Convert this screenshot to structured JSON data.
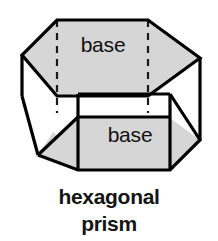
{
  "figure": {
    "name": "hexagonal-prism-diagram",
    "shape_type": "hexagonal prism",
    "top_face_label": "base",
    "bottom_face_label": "base",
    "colors": {
      "shaded_face": "#d6d6d6",
      "unshaded_face": "#ffffff",
      "edge": "#000000",
      "hidden_edge": "#1a1a1a",
      "background": "#ffffff",
      "text": "#111111"
    },
    "edges": {
      "visible_style": "solid",
      "hidden_style": "dashed",
      "stroke_width": 3.2,
      "hidden_stroke_width": 2.2,
      "hidden_dash_pattern": "7 6"
    },
    "geometry": {
      "top_hexagon": [
        [
          57,
          20
        ],
        [
          148,
          20
        ],
        [
          200,
          58
        ],
        [
          148,
          96
        ],
        [
          57,
          96
        ],
        [
          22,
          55
        ]
      ],
      "bottom_hexagon": [
        [
          78,
          94
        ],
        [
          170,
          94
        ],
        [
          200,
          140
        ],
        [
          170,
          170
        ],
        [
          78,
          170
        ],
        [
          38,
          155
        ]
      ],
      "top_label_position": [
        103,
        52
      ],
      "bottom_label_position": [
        130,
        134
      ]
    }
  },
  "caption": {
    "line1": "hexagonal",
    "line2": "prism"
  }
}
